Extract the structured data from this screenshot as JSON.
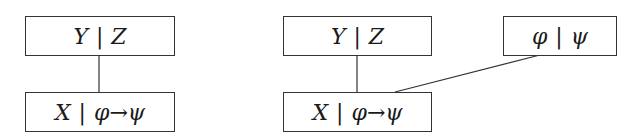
{
  "diagrams": [
    {
      "nodes": [
        {
          "id": "top",
          "left": "Y",
          "right": "Z"
        },
        {
          "id": "bottom",
          "left": "X",
          "right": "φ→ψ"
        }
      ],
      "edges": [
        [
          "top",
          "bottom"
        ]
      ]
    },
    {
      "nodes": [
        {
          "id": "top",
          "left": "Y",
          "right": "Z"
        },
        {
          "id": "bottom",
          "left": "X",
          "right": "φ→ψ"
        },
        {
          "id": "side",
          "left": "φ",
          "right": "ψ"
        }
      ],
      "edges": [
        [
          "top",
          "bottom"
        ],
        [
          "side",
          "bottom"
        ]
      ]
    }
  ],
  "separator": "|"
}
